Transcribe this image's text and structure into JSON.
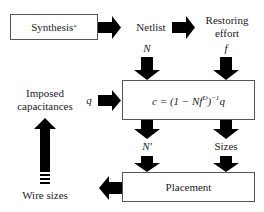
{
  "diagram": {
    "boxes": {
      "synthesis": "Synthesis",
      "synthesis_sup": "*",
      "formula_prefix": "c = (1 − Nf",
      "formula_exp1": "D",
      "formula_mid": ")",
      "formula_exp2": "−1",
      "formula_suffix": "q",
      "placement": "Placement"
    },
    "labels": {
      "netlist": "Netlist",
      "restoring_line1": "Restoring",
      "restoring_line2": "effort",
      "n": "N",
      "f": "f",
      "q": "q",
      "n_prime": "N′",
      "sizes": "Sizes",
      "imposed_line1": "Imposed",
      "imposed_line2": "capacitances",
      "wire_sizes": "Wire sizes"
    },
    "colors": {
      "arrow": "#000000",
      "box_border": "#555555",
      "text": "#222222"
    }
  }
}
